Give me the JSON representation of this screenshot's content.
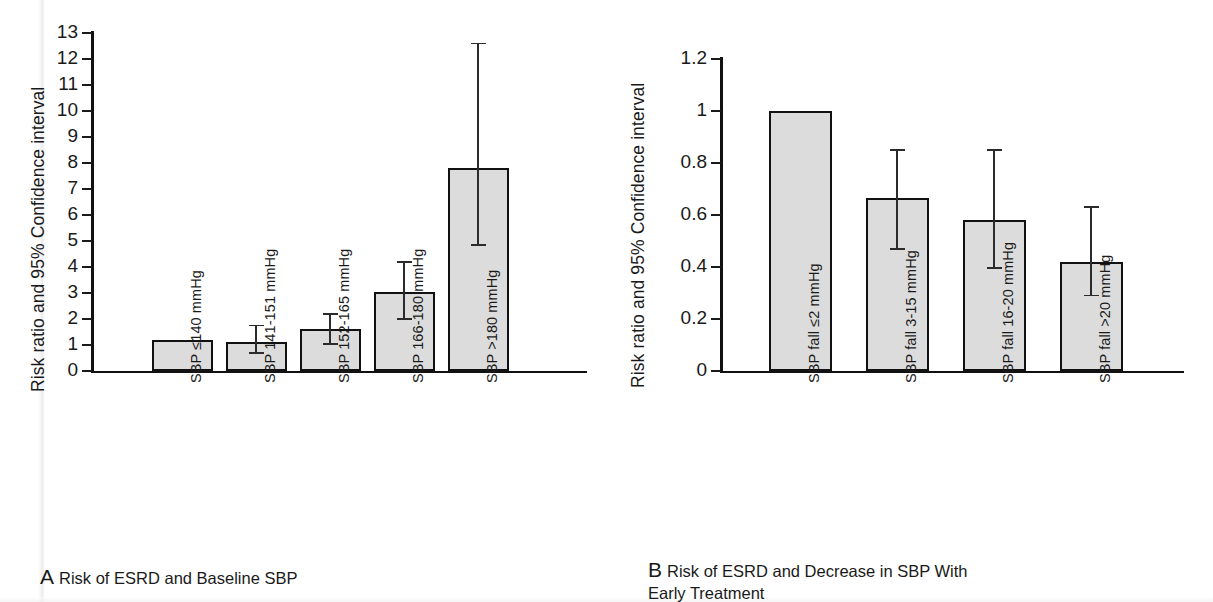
{
  "figure": {
    "background": "#ffffff",
    "bar_fill": "#dcdcdc",
    "bar_stroke": "#111111",
    "axis_color": "#111111"
  },
  "panel_a": {
    "ylabel": "Risk ratio and 95% Confidence interval",
    "caption_letter": "A",
    "caption_text": "Risk of ESRD and Baseline SBP",
    "ytick_labels": [
      "0",
      "1",
      "2",
      "3",
      "4",
      "5",
      "6",
      "7",
      "8",
      "9",
      "10",
      "11",
      "12",
      "13"
    ],
    "categories": [
      "SBP ≤140 mmHg",
      "SBP 141-151 mmHg",
      "SBP 152-165 mmHg",
      "SBP 166-180 mmHg",
      "SBP >180 mmHg"
    ]
  },
  "panel_b": {
    "ylabel": "Risk ratio and 95% Confidence interval",
    "caption_letter": "B",
    "caption_text": "Risk of ESRD and Decrease in SBP With\nEarly Treatment",
    "ytick_labels": [
      "0",
      "0.2",
      "0.4",
      "0.6",
      "0.8",
      "1",
      "1.2"
    ],
    "categories": [
      "SBP fall ≤2 mmHg",
      "SBP fall 3-15 mmHg",
      "SBP fall 16-20 mmHg",
      "SBP fall >20 mmHg"
    ]
  },
  "chart_data": [
    {
      "type": "bar",
      "panel": "A",
      "title": "Risk of ESRD and Baseline SBP",
      "xlabel": "",
      "ylabel": "Risk ratio and 95% Confidence interval",
      "ylim": [
        0,
        13
      ],
      "yticks": [
        0,
        1,
        2,
        3,
        4,
        5,
        6,
        7,
        8,
        9,
        10,
        11,
        12,
        13
      ],
      "grid": false,
      "legend": "none",
      "categories": [
        "SBP ≤140 mmHg",
        "SBP 141-151 mmHg",
        "SBP 152-165 mmHg",
        "SBP 166-180 mmHg",
        "SBP >180 mmHg"
      ],
      "values": [
        1.2,
        1.1,
        1.6,
        3.05,
        7.8
      ],
      "error_low": [
        null,
        0.7,
        1.05,
        2.0,
        4.85
      ],
      "error_high": [
        null,
        1.75,
        2.2,
        4.2,
        12.6
      ],
      "error_type": "95% confidence interval"
    },
    {
      "type": "bar",
      "panel": "B",
      "title": "Risk of ESRD and Decrease in SBP With Early Treatment",
      "xlabel": "",
      "ylabel": "Risk ratio and 95% Confidence interval",
      "ylim": [
        0,
        1.2
      ],
      "yticks": [
        0,
        0.2,
        0.4,
        0.6,
        0.8,
        1,
        1.2
      ],
      "grid": false,
      "legend": "none",
      "categories": [
        "SBP fall ≤2 mmHg",
        "SBP fall 3-15 mmHg",
        "SBP fall 16-20 mmHg",
        "SBP fall >20 mmHg"
      ],
      "values": [
        1.0,
        0.665,
        0.58,
        0.42
      ],
      "error_low": [
        null,
        0.47,
        0.395,
        0.29
      ],
      "error_high": [
        null,
        0.85,
        0.85,
        0.63
      ],
      "error_type": "95% confidence interval"
    }
  ]
}
